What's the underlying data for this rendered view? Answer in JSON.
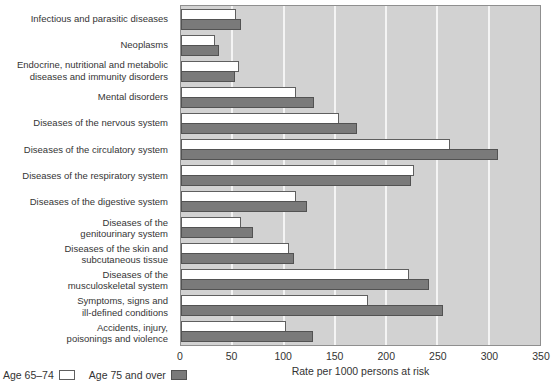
{
  "chart_data": {
    "type": "bar",
    "orientation": "horizontal",
    "title": "",
    "xlabel": "Rate per 1000 persons at risk",
    "ylabel": "",
    "xlim": [
      0,
      350
    ],
    "xticks": [
      0,
      50,
      100,
      150,
      200,
      250,
      300,
      350
    ],
    "grid": "vertical-light-gridlines-every-50",
    "legend_position": "bottom-left",
    "plot_background": "#d2d2d2",
    "categories": [
      "Infectious and parasitic diseases",
      "Neoplasms",
      "Endocrine, nutritional and metabolic\ndiseases and immunity disorders",
      "Mental disorders",
      "Diseases of the nervous system",
      "Diseases of the circulatory system",
      "Diseases of the respiratory system",
      "Diseases of the digestive system",
      "Diseases of the\ngenitourinary system",
      "Diseases of the skin and\nsubcutaneous tissue",
      "Diseases of the\nmusculoskeletal system",
      "Symptoms, signs and\nill-defined conditions",
      "Accidents, injury,\npoisonings and violence"
    ],
    "series": [
      {
        "name": "Age 65–74",
        "color": "#ffffff",
        "values": [
          52,
          31,
          55,
          110,
          152,
          260,
          225,
          110,
          57,
          103,
          220,
          180,
          100
        ]
      },
      {
        "name": "Age 75 and over",
        "color": "#7a7a7a",
        "values": [
          57,
          35,
          51,
          128,
          170,
          307,
          222,
          121,
          68,
          108,
          240,
          253,
          127
        ]
      }
    ]
  }
}
